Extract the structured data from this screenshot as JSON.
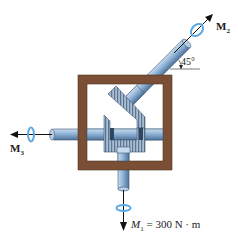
{
  "diagram": {
    "type": "gearbox-torque-diagram",
    "colors": {
      "frame": "#7a4f36",
      "shaft": "#8fb3d6",
      "shaft_dark": "#4f7298",
      "gear": "#9fb4cc",
      "arrow": "#111111",
      "rotation_indicator": "#5aa9e6"
    },
    "labels": {
      "m2": {
        "main": "M",
        "sub": "2"
      },
      "m3": {
        "main": "M",
        "sub": "3"
      },
      "m1": {
        "main": "M",
        "sub": "1",
        "equation": " = 300 N · m"
      },
      "angle": "45°"
    },
    "elements": [
      "frame",
      "diagonal-shaft",
      "horizontal-shaft",
      "vertical-shaft",
      "bevel-gear-diagonal",
      "bevel-gear-u-shaped",
      "bevel-gear-bottom"
    ]
  }
}
